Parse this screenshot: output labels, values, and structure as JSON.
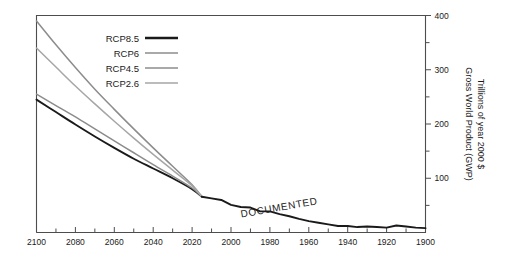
{
  "chart_data": {
    "type": "line",
    "title": "",
    "subtitle": "",
    "xlabel": "",
    "ylabel": "Gross World Product (GWP)",
    "ylabel_line2": "Trillions of year 2000 $",
    "xlim": [
      2100,
      1900
    ],
    "ylim": [
      0,
      400
    ],
    "x_axis_reversed": true,
    "y_axis_position": "right",
    "grid": false,
    "legend_position": "upper-left-inside",
    "x_tick_labels": [
      "2100",
      "2080",
      "2060",
      "2040",
      "2020",
      "2000",
      "1980",
      "1960",
      "1940",
      "1920",
      "1900"
    ],
    "x_tick_values": [
      2100,
      2080,
      2060,
      2040,
      2020,
      2000,
      1980,
      1960,
      1940,
      1920,
      1900
    ],
    "x_minor_tick_values": [
      2090,
      2070,
      2050,
      2030,
      2010,
      1990,
      1970,
      1950,
      1930,
      1910
    ],
    "y_tick_labels": [
      "400",
      "300",
      "200",
      "100"
    ],
    "y_tick_values": [
      400,
      300,
      200,
      100
    ],
    "y_minor_tick_values": [
      350,
      250,
      150,
      50
    ],
    "annotations": [
      {
        "text": "DOCUMENTED",
        "x": 1975,
        "y": 40,
        "rotation": -10
      }
    ],
    "series": [
      {
        "name": "RCP8.5",
        "color": "#1a1a1a",
        "width": 1.9,
        "x": [
          2100,
          2090,
          2080,
          2070,
          2060,
          2050,
          2040,
          2030,
          2020,
          2015
        ],
        "values": [
          245,
          222,
          199,
          177,
          156,
          136,
          118,
          100,
          80,
          66
        ]
      },
      {
        "name": "RCP6",
        "color": "#8c8c8c",
        "width": 1.5,
        "x": [
          2100,
          2090,
          2080,
          2070,
          2060,
          2050,
          2040,
          2030,
          2020,
          2015
        ],
        "values": [
          390,
          346,
          304,
          264,
          227,
          191,
          156,
          122,
          88,
          66
        ]
      },
      {
        "name": "RCP4.5",
        "color": "#8c8c8c",
        "width": 1.5,
        "x": [
          2100,
          2090,
          2080,
          2070,
          2060,
          2050,
          2040,
          2030,
          2020,
          2015
        ],
        "values": [
          255,
          234,
          213,
          191,
          169,
          147,
          125,
          104,
          82,
          66
        ]
      },
      {
        "name": "RCP2.6",
        "color": "#a6a6a6",
        "width": 1.5,
        "x": [
          2100,
          2090,
          2080,
          2070,
          2060,
          2050,
          2040,
          2030,
          2020,
          2015
        ],
        "values": [
          340,
          305,
          270,
          237,
          205,
          174,
          144,
          115,
          86,
          66
        ]
      },
      {
        "name": "DOCUMENTED",
        "color": "#1a1a1a",
        "width": 1.9,
        "x": [
          2015,
          2010,
          2005,
          2000,
          1995,
          1990,
          1985,
          1980,
          1975,
          1970,
          1965,
          1960,
          1955,
          1950,
          1945,
          1940,
          1935,
          1930,
          1925,
          1920,
          1915,
          1910,
          1905,
          1900
        ],
        "values": [
          66,
          63,
          60,
          51,
          47,
          46,
          39,
          39,
          34,
          30,
          25,
          21,
          18,
          15,
          12,
          12,
          10,
          11,
          10,
          9,
          13,
          11,
          9,
          8
        ]
      }
    ]
  },
  "legend": {
    "entries": [
      {
        "label": "RCP8.5"
      },
      {
        "label": "RCP6"
      },
      {
        "label": "RCP4.5"
      },
      {
        "label": "RCP2.6"
      }
    ]
  },
  "axes": {
    "y_title_line1": "Gross World Product (GWP)",
    "y_title_line2": "Trillions of year 2000 $"
  },
  "colors": {
    "rcp85": "#1a1a1a",
    "rcp6": "#8c8c8c",
    "rcp45": "#8c8c8c",
    "rcp26": "#a6a6a6",
    "frame": "#4d4d4d",
    "text": "#1a1a1a",
    "background": "#ffffff"
  }
}
